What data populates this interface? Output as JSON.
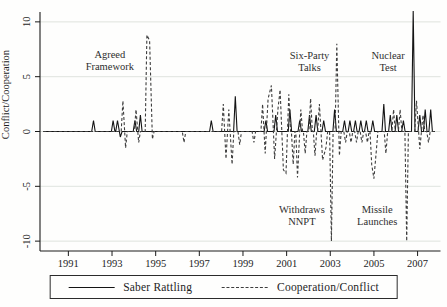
{
  "chart_data": {
    "type": "line",
    "title": "",
    "xlabel": "",
    "ylabel": "Conflict/Cooperation",
    "xlim": [
      1989.7,
      2008.05
    ],
    "ylim": [
      -10.9,
      10.9
    ],
    "x_ticks": [
      1991,
      1993,
      1995,
      1997,
      1999,
      2001,
      2003,
      2005,
      2007
    ],
    "y_ticks": [
      10,
      5,
      0,
      -5,
      -10
    ],
    "grid": "horizontal",
    "gridline_color": "#dbe0da",
    "legend_position": "bottom-center",
    "baseline": 0,
    "series": [
      {
        "name": "Saber Rattling",
        "style": "solid",
        "color": "#141414",
        "x_start": 1989.85,
        "x_end": 2007.8,
        "spikes": [
          [
            1992.15,
            1
          ],
          [
            1993.05,
            1
          ],
          [
            1993.25,
            1
          ],
          [
            1993.38,
            -0.5
          ],
          [
            1994.05,
            1
          ],
          [
            1994.3,
            1.5
          ],
          [
            1997.55,
            1
          ],
          [
            1998.65,
            3.2
          ],
          [
            2000.05,
            1
          ],
          [
            2000.5,
            1.5
          ],
          [
            2001.15,
            2
          ],
          [
            2001.6,
            1
          ],
          [
            2002.05,
            1.5
          ],
          [
            2002.35,
            1.5
          ],
          [
            2002.7,
            1
          ],
          [
            2003.2,
            2
          ],
          [
            2003.65,
            1
          ],
          [
            2003.9,
            1
          ],
          [
            2004.15,
            1
          ],
          [
            2004.4,
            1
          ],
          [
            2004.65,
            1
          ],
          [
            2004.95,
            1
          ],
          [
            2005.45,
            2.5
          ],
          [
            2005.75,
            1.5
          ],
          [
            2006.05,
            1.5
          ],
          [
            2006.35,
            1
          ],
          [
            2006.8,
            11
          ],
          [
            2007.1,
            1.5
          ],
          [
            2007.35,
            2
          ],
          [
            2007.6,
            2
          ]
        ]
      },
      {
        "name": "Cooperation/Conflict",
        "style": "dashed",
        "color": "#3d3d3d",
        "x_start": 1989.85,
        "x_end": 2007.8,
        "spikes": [
          [
            1993.5,
            2.8
          ],
          [
            1993.62,
            -1.5
          ],
          [
            1994.1,
            2
          ],
          [
            1994.22,
            -1
          ],
          [
            1994.6,
            8.8
          ],
          [
            1994.72,
            8.3
          ],
          [
            1994.85,
            -0.7
          ],
          [
            1996.3,
            -1
          ],
          [
            1998.1,
            2.5
          ],
          [
            1998.22,
            -2.5
          ],
          [
            1998.35,
            2
          ],
          [
            1998.5,
            -3
          ],
          [
            1998.85,
            -1.2
          ],
          [
            1999.5,
            -1
          ],
          [
            1999.9,
            2.5
          ],
          [
            2000.02,
            -2
          ],
          [
            2000.15,
            3
          ],
          [
            2000.3,
            4.2
          ],
          [
            2000.45,
            -2.5
          ],
          [
            2000.6,
            2
          ],
          [
            2000.7,
            3.8
          ],
          [
            2000.85,
            -3.5
          ],
          [
            2000.97,
            -3.8
          ],
          [
            2001.1,
            3.4
          ],
          [
            2001.3,
            -3
          ],
          [
            2001.5,
            -4.2
          ],
          [
            2001.65,
            2
          ],
          [
            2001.85,
            -2
          ],
          [
            2002.1,
            3
          ],
          [
            2002.3,
            -2.2
          ],
          [
            2002.5,
            2.5
          ],
          [
            2002.65,
            -2.6
          ],
          [
            2002.8,
            -1.5
          ],
          [
            2003.05,
            -10
          ],
          [
            2003.3,
            8
          ],
          [
            2003.42,
            -2.2
          ],
          [
            2003.7,
            -1
          ],
          [
            2003.95,
            -1
          ],
          [
            2004.2,
            -1
          ],
          [
            2004.45,
            -1
          ],
          [
            2004.7,
            -1
          ],
          [
            2004.9,
            -3
          ],
          [
            2005.0,
            -4.3
          ],
          [
            2005.1,
            -2
          ],
          [
            2005.55,
            -2
          ],
          [
            2005.9,
            2
          ],
          [
            2006.2,
            2
          ],
          [
            2006.5,
            -10
          ],
          [
            2006.95,
            2.8
          ],
          [
            2007.1,
            -1.6
          ],
          [
            2007.25,
            1.5
          ],
          [
            2007.5,
            -1
          ]
        ]
      }
    ],
    "annotations": [
      {
        "id": "agreed-framework",
        "text": "Agreed\nFramework",
        "x_year": 1992.9,
        "y_value": 6.7
      },
      {
        "id": "six-party-talks",
        "text": "Six-Party\nTalks",
        "x_year": 2002.05,
        "y_value": 6.6
      },
      {
        "id": "nuclear-test",
        "text": "Nuclear\nTest",
        "x_year": 2005.65,
        "y_value": 6.6
      },
      {
        "id": "withdraws-nnpt",
        "text": "Withdraws\nNNPT",
        "x_year": 2001.7,
        "y_value": -7.4
      },
      {
        "id": "missile-launches",
        "text": "Missile\nLaunches",
        "x_year": 2005.15,
        "y_value": -7.4
      }
    ],
    "legend": [
      {
        "label": "Saber Rattling",
        "style": "solid"
      },
      {
        "label": "Cooperation/Conflict",
        "style": "dashed"
      }
    ]
  }
}
